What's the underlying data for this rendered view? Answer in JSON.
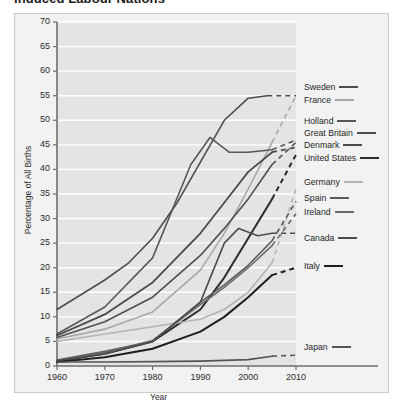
{
  "title": "Induced Labour Nations",
  "chart_data": {
    "type": "line",
    "title": "Induced Labour Nations",
    "xlabel": "Year",
    "ylabel": "Percentage of All Births",
    "xlim": [
      1960,
      2010
    ],
    "ylim": [
      0,
      70
    ],
    "xticks": [
      1960,
      1970,
      1980,
      1990,
      2000,
      2010
    ],
    "yticks": [
      0,
      5,
      10,
      15,
      20,
      25,
      30,
      35,
      40,
      45,
      50,
      55,
      60,
      65,
      70
    ],
    "grid": "horizontal-white",
    "legend_position": "right",
    "plot_background": "#e4e4e4",
    "gridline_color": "#ffffff",
    "note": "Solid segments are observed data through about 2005; dashed segments are projections to 2010.",
    "series": [
      {
        "name": "Sweden",
        "color": "#4d4d4d",
        "width": 1.6,
        "x": [
          1960,
          1965,
          1970,
          1975,
          1980,
          1985,
          1990,
          1995,
          2000,
          2004
        ],
        "values": [
          11.5,
          14.5,
          17.5,
          21.0,
          26.0,
          33.0,
          41.5,
          50.0,
          54.5,
          55.0
        ],
        "dashed_x": [
          2004,
          2010
        ],
        "dashed_values": [
          55.0,
          55.0
        ]
      },
      {
        "name": "France",
        "color": "#a8a8a8",
        "width": 1.6,
        "x": [
          1960,
          1970,
          1980,
          1990,
          1995,
          2000,
          2005
        ],
        "values": [
          5.5,
          7.5,
          11.0,
          19.5,
          27.0,
          36.0,
          45.5
        ],
        "dashed_x": [
          2005,
          2010
        ],
        "dashed_values": [
          45.5,
          55.0
        ]
      },
      {
        "name": "Holland",
        "color": "#585858",
        "width": 1.6,
        "x": [
          1960,
          1970,
          1980,
          1988,
          1992,
          1996,
          2000,
          2005
        ],
        "values": [
          6.5,
          12.0,
          22.0,
          41.0,
          46.5,
          43.5,
          43.5,
          44.0
        ],
        "dashed_x": [
          2005,
          2010
        ],
        "dashed_values": [
          44.0,
          46.0
        ]
      },
      {
        "name": "Great Britain",
        "color": "#4f4f4f",
        "width": 1.6,
        "x": [
          1960,
          1970,
          1980,
          1990,
          1995,
          2000,
          2005
        ],
        "values": [
          5.8,
          9.0,
          14.0,
          22.5,
          28.0,
          34.0,
          41.0
        ],
        "dashed_x": [
          2005,
          2010
        ],
        "dashed_values": [
          41.0,
          45.5
        ]
      },
      {
        "name": "Denmark",
        "color": "#4a4a4a",
        "width": 1.8,
        "x": [
          1960,
          1970,
          1980,
          1990,
          1996,
          2000,
          2005
        ],
        "values": [
          6.2,
          10.5,
          17.0,
          27.0,
          34.5,
          39.5,
          43.5
        ],
        "dashed_x": [
          2005,
          2010
        ],
        "dashed_values": [
          43.5,
          44.5
        ]
      },
      {
        "name": "United States",
        "color": "#2b2b2b",
        "width": 2.0,
        "x": [
          1960,
          1970,
          1980,
          1990,
          1995,
          2000,
          2005
        ],
        "values": [
          1.0,
          2.5,
          5.0,
          11.5,
          18.0,
          26.0,
          34.0
        ],
        "dashed_x": [
          2005,
          2010
        ],
        "dashed_values": [
          34.0,
          43.0
        ]
      },
      {
        "name": "Germany",
        "color": "#b4b4b4",
        "width": 1.6,
        "x": [
          1960,
          1970,
          1980,
          1990,
          1995,
          2000,
          2005
        ],
        "values": [
          5.0,
          6.5,
          8.0,
          9.5,
          11.5,
          15.0,
          21.0
        ],
        "dashed_x": [
          2005,
          2010
        ],
        "dashed_values": [
          21.0,
          36.0
        ]
      },
      {
        "name": "Spain",
        "color": "#5a5a5a",
        "width": 1.6,
        "x": [
          1960,
          1970,
          1980,
          1990,
          1995,
          2000,
          2005
        ],
        "values": [
          1.2,
          3.0,
          5.0,
          13.0,
          16.5,
          20.5,
          25.5
        ],
        "dashed_x": [
          2005,
          2010
        ],
        "dashed_values": [
          25.5,
          33.5
        ]
      },
      {
        "name": "Ireland",
        "color": "#6a6a6a",
        "width": 1.6,
        "x": [
          1960,
          1970,
          1980,
          1990,
          1995,
          2000,
          2005
        ],
        "values": [
          1.0,
          2.8,
          5.2,
          12.5,
          16.0,
          20.0,
          24.5
        ],
        "dashed_x": [
          2005,
          2010
        ],
        "dashed_values": [
          24.5,
          31.0
        ]
      },
      {
        "name": "Canada",
        "color": "#4d4d4d",
        "width": 1.6,
        "x": [
          1960,
          1970,
          1980,
          1990,
          1995,
          1998,
          2002,
          2005
        ],
        "values": [
          1.0,
          2.5,
          5.0,
          13.0,
          25.0,
          28.0,
          26.5,
          27.0
        ],
        "dashed_x": [
          2005,
          2010
        ],
        "dashed_values": [
          27.0,
          27.0
        ]
      },
      {
        "name": "Italy",
        "color": "#1f1f1f",
        "width": 2.0,
        "x": [
          1960,
          1970,
          1980,
          1990,
          1995,
          2000,
          2005
        ],
        "values": [
          0.8,
          1.8,
          3.5,
          7.0,
          10.0,
          14.0,
          18.5
        ],
        "dashed_x": [
          2005,
          2010
        ],
        "dashed_values": [
          18.5,
          20.0
        ]
      },
      {
        "name": "Japan",
        "color": "#555555",
        "width": 1.6,
        "x": [
          1960,
          1970,
          1980,
          1990,
          2000,
          2005
        ],
        "values": [
          0.8,
          0.8,
          0.9,
          1.0,
          1.3,
          2.0
        ],
        "dashed_x": [
          2005,
          2010
        ],
        "dashed_values": [
          2.0,
          2.2
        ]
      }
    ]
  },
  "legend": [
    {
      "label": "Sweden",
      "color": "#4d4d4d",
      "width": 2.0,
      "y": 88
    },
    {
      "label": "France",
      "color": "#a8a8a8",
      "width": 2.0,
      "y": 101
    },
    {
      "label": "Holland",
      "color": "#585858",
      "width": 2.0,
      "y": 122
    },
    {
      "label": "Great Britain",
      "color": "#4f4f4f",
      "width": 2.0,
      "y": 134
    },
    {
      "label": "Denmark",
      "color": "#4a4a4a",
      "width": 2.0,
      "y": 146
    },
    {
      "label": "United States",
      "color": "#2b2b2b",
      "width": 2.6,
      "y": 159
    },
    {
      "label": "Germany",
      "color": "#b4b4b4",
      "width": 2.0,
      "y": 183
    },
    {
      "label": "Spain",
      "color": "#5a5a5a",
      "width": 2.0,
      "y": 199
    },
    {
      "label": "Ireland",
      "color": "#6a6a6a",
      "width": 2.0,
      "y": 213
    },
    {
      "label": "Canada",
      "color": "#4d4d4d",
      "width": 2.2,
      "y": 239
    },
    {
      "label": "Italy",
      "color": "#1f1f1f",
      "width": 2.6,
      "y": 267
    },
    {
      "label": "Japan",
      "color": "#555555",
      "width": 2.0,
      "y": 348
    }
  ]
}
